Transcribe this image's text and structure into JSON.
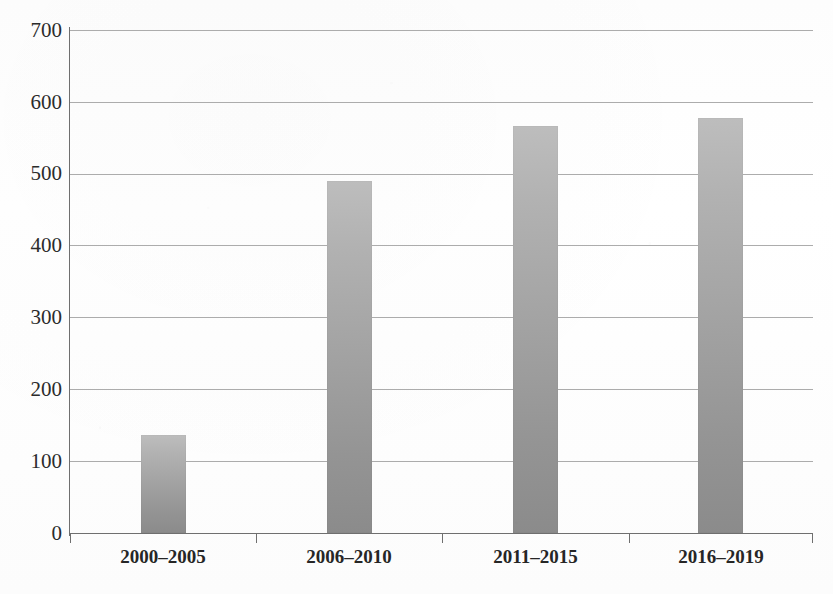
{
  "chart_data": {
    "type": "bar",
    "title": "",
    "xlabel": "",
    "ylabel": "",
    "categories": [
      "2000–2005",
      "2006–2010",
      "2011–2015",
      "2016–2019"
    ],
    "values": [
      136,
      490,
      566,
      578
    ],
    "ylim": [
      0,
      700
    ],
    "ytick_labels": [
      "700",
      "600",
      "500",
      "400",
      "300",
      "200",
      "100",
      "0"
    ],
    "ytick_values": [
      700,
      600,
      500,
      400,
      300,
      200,
      100,
      0
    ],
    "ytick_step": 100,
    "grid": true,
    "legend": "none",
    "bar_color_top": "#bdbdbd",
    "bar_color_bottom": "#8b8b8b",
    "axis_color": "#6f6f6f",
    "gridline_color": "#9e9e9e",
    "background_color": "#ffffff"
  }
}
